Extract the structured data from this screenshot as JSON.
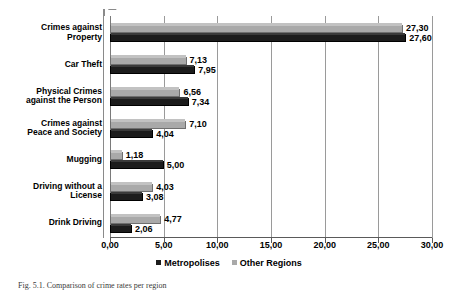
{
  "chart_data": {
    "type": "bar",
    "orientation": "horizontal",
    "title": "",
    "xlabel": "",
    "ylabel": "",
    "xlim": [
      0,
      30
    ],
    "xticks": [
      "0,00",
      "5,00",
      "10,00",
      "15,00",
      "20,00",
      "25,00",
      "30,00"
    ],
    "xtick_values": [
      0,
      5,
      10,
      15,
      20,
      25,
      30
    ],
    "grid": true,
    "grid_axis": "x",
    "legend_position": "bottom",
    "decimal_separator": ",",
    "categories": [
      "Crimes against Property",
      "Car Theft",
      "Physical Crimes against the Person",
      "Crimes against Peace and Society",
      "Mugging",
      "Driving without a License",
      "Drink Driving"
    ],
    "category_lines": [
      [
        "Crimes against",
        "Property"
      ],
      [
        "Car Theft"
      ],
      [
        "Physical Crimes",
        "against the Person"
      ],
      [
        "Crimes against",
        "Peace and Society"
      ],
      [
        "Mugging"
      ],
      [
        "Driving without a",
        "License"
      ],
      [
        "Drink Driving"
      ]
    ],
    "series": [
      {
        "name": "Metropolises",
        "color": "#1c1c1c",
        "values": [
          27.6,
          7.95,
          7.34,
          4.04,
          5.0,
          3.08,
          2.06
        ],
        "labels": [
          "27,60",
          "7,95",
          "7,34",
          "4,04",
          "5,00",
          "3,08",
          "2,06"
        ]
      },
      {
        "name": "Other Regions",
        "color": "#a9a9a9",
        "values": [
          27.3,
          7.13,
          6.56,
          7.1,
          1.18,
          4.03,
          4.77
        ],
        "labels": [
          "27,30",
          "7,13",
          "6,56",
          "7,10",
          "1,18",
          "4,03",
          "4,77"
        ]
      }
    ]
  },
  "legend": {
    "items": [
      {
        "label": "Metropolises",
        "color": "#1c1c1c"
      },
      {
        "label": "Other Regions",
        "color": "#a9a9a9"
      }
    ]
  },
  "caption": {
    "text": "Fig. 5.1. Comparison of crime rates per region"
  }
}
